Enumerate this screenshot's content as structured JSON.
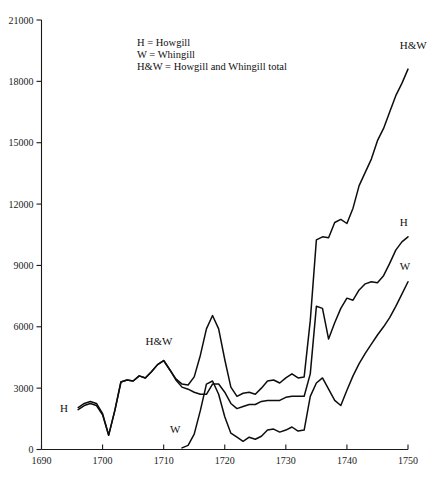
{
  "chart_data": {
    "type": "line",
    "title": "",
    "subtitle": "",
    "xlabel": "",
    "ylabel": "",
    "xlim": [
      1690,
      1750
    ],
    "ylim": [
      0,
      21000
    ],
    "grid": false,
    "legend_position": "inside-top-center",
    "x_ticks": [
      "1690",
      "1700",
      "1710",
      "1720",
      "1730",
      "1740",
      "1750"
    ],
    "x_tick_values": [
      1690,
      1700,
      1710,
      1720,
      1730,
      1740,
      1750
    ],
    "y_ticks": [
      "0",
      "3000",
      "6000",
      "9000",
      "12000",
      "15000",
      "18000",
      "21000"
    ],
    "y_tick_values": [
      0,
      3000,
      6000,
      9000,
      12000,
      15000,
      18000,
      21000
    ],
    "annotations": [
      {
        "text": "H = Howgill",
        "kind": "legend-line"
      },
      {
        "text": "W = Whingill",
        "kind": "legend-line"
      },
      {
        "text": "H&W = Howgill and Whingill total",
        "kind": "legend-line"
      }
    ],
    "series": [
      {
        "name": "H&W",
        "label": "H&W",
        "label_x": 1748,
        "label_y": 19600,
        "x": [
          1696,
          1697,
          1698,
          1699,
          1700,
          1701,
          1702,
          1703,
          1704,
          1705,
          1706,
          1707,
          1708,
          1709,
          1710,
          1711,
          1712,
          1713,
          1714,
          1715,
          1716,
          1717,
          1718,
          1719,
          1720,
          1721,
          1722,
          1723,
          1724,
          1725,
          1726,
          1727,
          1728,
          1729,
          1730,
          1731,
          1732,
          1733,
          1734,
          1735,
          1736,
          1737,
          1738,
          1739,
          1740,
          1741,
          1742,
          1743,
          1744,
          1745,
          1746,
          1747,
          1748,
          1749,
          1750
        ],
        "values": [
          2050,
          2250,
          2350,
          2250,
          1750,
          700,
          1900,
          3300,
          3400,
          3350,
          3600,
          3500,
          3800,
          4150,
          4350,
          3900,
          3450,
          3200,
          3150,
          3550,
          4600,
          5900,
          6550,
          5900,
          4400,
          3050,
          2600,
          2750,
          2800,
          2700,
          3000,
          3350,
          3400,
          3250,
          3500,
          3700,
          3500,
          3550,
          6300,
          10250,
          10400,
          10350,
          11100,
          11250,
          11050,
          11800,
          12900,
          13550,
          14200,
          15100,
          15700,
          16500,
          17300,
          17900,
          18600
        ]
      },
      {
        "name": "H",
        "label": "H",
        "label_x": 1748,
        "label_y": 10950,
        "x": [
          1696,
          1697,
          1698,
          1699,
          1700,
          1701,
          1702,
          1703,
          1704,
          1705,
          1706,
          1707,
          1708,
          1709,
          1710,
          1711,
          1712,
          1713,
          1714,
          1715,
          1716,
          1717,
          1718,
          1719,
          1720,
          1721,
          1722,
          1723,
          1724,
          1725,
          1726,
          1727,
          1728,
          1729,
          1730,
          1731,
          1732,
          1733,
          1734,
          1735,
          1736,
          1737,
          1738,
          1739,
          1740,
          1741,
          1742,
          1743,
          1744,
          1745,
          1746,
          1747,
          1748,
          1749,
          1750
        ],
        "values": [
          1950,
          2150,
          2250,
          2150,
          1700,
          700,
          1900,
          3300,
          3400,
          3350,
          3600,
          3500,
          3800,
          4150,
          4350,
          3900,
          3400,
          3050,
          2950,
          2800,
          2700,
          2700,
          3200,
          3200,
          2800,
          2250,
          2000,
          2100,
          2200,
          2200,
          2350,
          2400,
          2400,
          2400,
          2550,
          2600,
          2600,
          2600,
          3700,
          7000,
          6900,
          5400,
          6200,
          6900,
          7400,
          7300,
          7800,
          8100,
          8200,
          8150,
          8500,
          9100,
          9750,
          10150,
          10400
        ]
      },
      {
        "name": "W",
        "label": "W",
        "label_x": 1748,
        "label_y": 8800,
        "label_start_x": 1712,
        "label_start_y": 700,
        "x": [
          1713,
          1714,
          1715,
          1716,
          1717,
          1718,
          1719,
          1720,
          1721,
          1722,
          1723,
          1724,
          1725,
          1726,
          1727,
          1728,
          1729,
          1730,
          1731,
          1732,
          1733,
          1734,
          1735,
          1736,
          1737,
          1738,
          1739,
          1740,
          1741,
          1742,
          1743,
          1744,
          1745,
          1746,
          1747,
          1748,
          1749,
          1750
        ],
        "values": [
          80,
          200,
          750,
          1900,
          3200,
          3350,
          2700,
          1600,
          800,
          600,
          400,
          600,
          500,
          650,
          950,
          1000,
          850,
          950,
          1100,
          900,
          950,
          2600,
          3250,
          3500,
          2950,
          2400,
          2150,
          2900,
          3600,
          4200,
          4700,
          5150,
          5600,
          6000,
          6450,
          7000,
          7600,
          8200
        ]
      }
    ]
  },
  "legend": {
    "line1": "H = Howgill",
    "line2": "W = Whingill",
    "line3": "H&W = Howgill and Whingill total"
  },
  "labels": {
    "hw_right": "H&W",
    "hw_mid": "H&W",
    "h_right": "H",
    "h_left": "H",
    "w_right": "W",
    "w_left": "W"
  }
}
